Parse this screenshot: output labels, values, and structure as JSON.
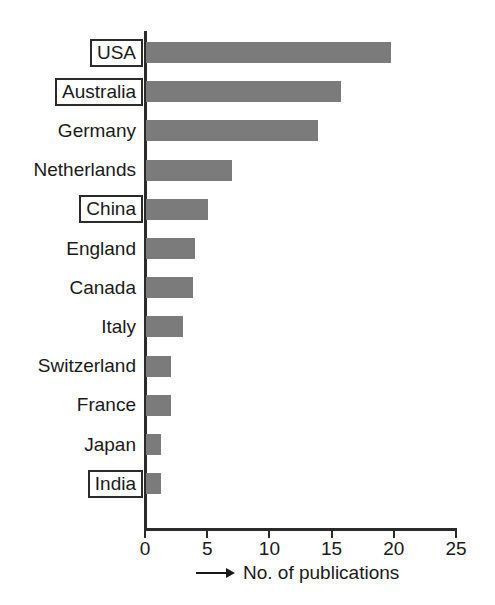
{
  "chart_data": {
    "type": "bar",
    "orientation": "horizontal",
    "title": "",
    "subtitle": "",
    "xlabel": "No. of publications",
    "ylabel": "",
    "xlim": [
      0,
      25
    ],
    "ylim": null,
    "grid": false,
    "legend": null,
    "xticks": [
      "0",
      "5",
      "10",
      "15",
      "20",
      "25"
    ],
    "xtick_values": [
      0,
      5,
      10,
      15,
      20,
      25
    ],
    "categories": [
      "USA",
      "Australia",
      "Germany",
      "Netherlands",
      "China",
      "England",
      "Canada",
      "Italy",
      "Switzerland",
      "France",
      "Japan",
      "India"
    ],
    "values": [
      19.7,
      15.7,
      13.8,
      6.9,
      5.0,
      3.9,
      3.8,
      3.0,
      2.0,
      2.0,
      1.2,
      1.2
    ],
    "highlighted_categories": [
      "USA",
      "Australia",
      "China",
      "India"
    ],
    "bar_color": "#7b7b7b",
    "axis_color": "#2b2b2b",
    "text_color": "#1a1a1a",
    "background_color": "#ffffff",
    "axis_title_arrow": "right-arrow-icon"
  },
  "axis": {
    "x_title": "No. of publications",
    "x_max": 25,
    "x_min": 0,
    "tick_step": 5
  }
}
